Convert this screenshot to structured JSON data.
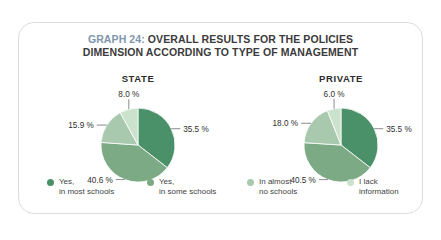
{
  "card": {
    "title_prefix": "GRAPH 24:",
    "title_rest": " OVERALL RESULTS FOR THE POLICIES",
    "title_line2": "DIMENSION ACCORDING TO TYPE OF MANAGEMENT",
    "title_accent_color": "#7e96ad",
    "border_color": "#dcdcdc"
  },
  "legend": {
    "items": [
      {
        "label": "Yes,\nin most schools",
        "color": "#4a9068"
      },
      {
        "label": "Yes,\nin some schools",
        "color": "#7caa84"
      },
      {
        "label": "In almost\nno schools",
        "color": "#a9c9ae"
      },
      {
        "label": "I lack\ninformation",
        "color": "#cbe2cd"
      }
    ]
  },
  "chart_data": [
    {
      "type": "pie",
      "title": "STATE",
      "categories": [
        "Yes, in most schools",
        "Yes, in some schools",
        "In almost no schools",
        "I lack information"
      ],
      "values": [
        35.5,
        40.6,
        15.9,
        8.0
      ],
      "labels": [
        "35.5 %",
        "40.6 %",
        "15.9 %",
        "8.0 %"
      ],
      "colors": [
        "#4a9068",
        "#7caa84",
        "#a9c9ae",
        "#cbe2cd"
      ],
      "start_angle": 0,
      "unit": "%"
    },
    {
      "type": "pie",
      "title": "PRIVATE",
      "categories": [
        "Yes, in most schools",
        "Yes, in some schools",
        "In almost no schools",
        "I lack information"
      ],
      "values": [
        35.5,
        40.5,
        18.0,
        6.0
      ],
      "labels": [
        "35.5 %",
        "40.5 %",
        "18.0 %",
        "6.0 %"
      ],
      "colors": [
        "#4a9068",
        "#7caa84",
        "#a9c9ae",
        "#cbe2cd"
      ],
      "start_angle": 0,
      "unit": "%"
    }
  ]
}
